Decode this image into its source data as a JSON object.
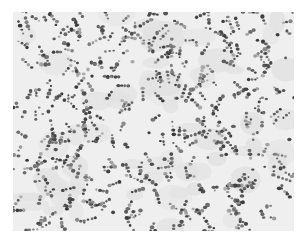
{
  "image": {
    "kind": "grayscale micrograph",
    "subject": "stained cell nuclei scattered across tissue section",
    "background_color": "#ffffff",
    "field_color": "#efefef",
    "field_bounds": {
      "x": 13,
      "y": 12,
      "width": 281,
      "height": 219
    },
    "nuclei": {
      "count": 1100,
      "color_dark": "#3a3a3a",
      "color_mid": "#6a6a6a",
      "color_light": "#9a9a9a",
      "radius_min": 1.0,
      "radius_max": 2.0,
      "seed": 20240613
    },
    "stroma_patches": {
      "count": 60,
      "color": "#e2e2e2"
    }
  }
}
